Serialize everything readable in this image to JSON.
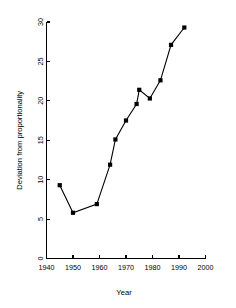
{
  "chart_data": {
    "type": "line",
    "title": "",
    "xlabel": "Year",
    "ylabel": "Deviation from proportionality",
    "xlim": [
      1940,
      2000
    ],
    "ylim": [
      0,
      30
    ],
    "xticks": [
      1940,
      1950,
      1960,
      1970,
      1980,
      1990,
      2000
    ],
    "yticks": [
      0,
      5,
      10,
      15,
      20,
      25,
      30
    ],
    "grid": false,
    "legend": null,
    "marker": "filled-square",
    "line_color": "#000000",
    "marker_color": "#000000",
    "background_color": "#ffffff",
    "x": [
      1945,
      1950,
      1959,
      1964,
      1966,
      1970,
      1974,
      1975,
      1979,
      1983,
      1987,
      1992
    ],
    "values": [
      9.3,
      5.8,
      6.9,
      11.9,
      15.1,
      17.5,
      19.6,
      21.4,
      20.3,
      22.6,
      27.1,
      29.3
    ],
    "series": [
      {
        "name": "Deviation from proportionality",
        "x": [
          1945,
          1950,
          1959,
          1964,
          1966,
          1970,
          1974,
          1975,
          1979,
          1983,
          1987,
          1992
        ],
        "values": [
          9.3,
          5.8,
          6.9,
          11.9,
          15.1,
          17.5,
          19.6,
          21.4,
          20.3,
          22.6,
          27.1,
          29.3
        ]
      }
    ]
  }
}
